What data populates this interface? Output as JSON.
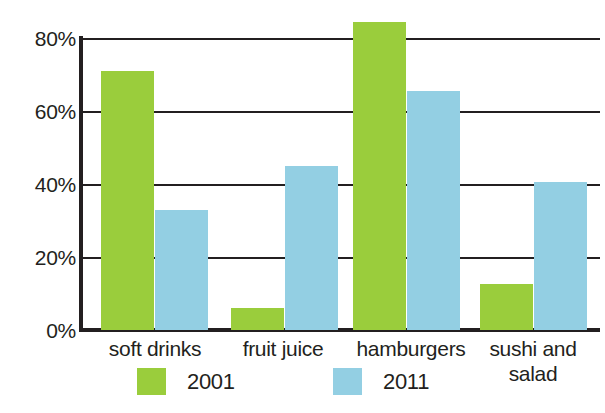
{
  "chart_data": {
    "type": "bar",
    "title": "",
    "xlabel": "",
    "ylabel": "",
    "grid": true,
    "legend_position": "bottom",
    "ylim": [
      0,
      80
    ],
    "yticks": [
      "0%",
      "20%",
      "40%",
      "60%",
      "80%"
    ],
    "ytick_values": [
      0,
      20,
      40,
      60,
      80
    ],
    "categories": [
      "soft drinks",
      "fruit juice",
      "hamburgers",
      "sushi and salad"
    ],
    "category_lines": [
      [
        "soft drinks"
      ],
      [
        "fruit juice"
      ],
      [
        "hamburgers"
      ],
      [
        "sushi and",
        "salad"
      ]
    ],
    "series": [
      {
        "name": "2001",
        "color": "#9ACD3C",
        "values": [
          71,
          6,
          84.5,
          12.5
        ]
      },
      {
        "name": "2011",
        "color": "#93CFE3",
        "values": [
          33,
          45,
          65.5,
          40.5
        ]
      }
    ]
  },
  "colors": {
    "series_2001": "#9ACD3C",
    "series_2011": "#93CFE3",
    "axis": "#231f20",
    "text": "#231f20",
    "background": "#ffffff"
  },
  "legend": {
    "entries": [
      {
        "label": "2001",
        "swatch": "green"
      },
      {
        "label": "2011",
        "swatch": "blue"
      }
    ]
  }
}
